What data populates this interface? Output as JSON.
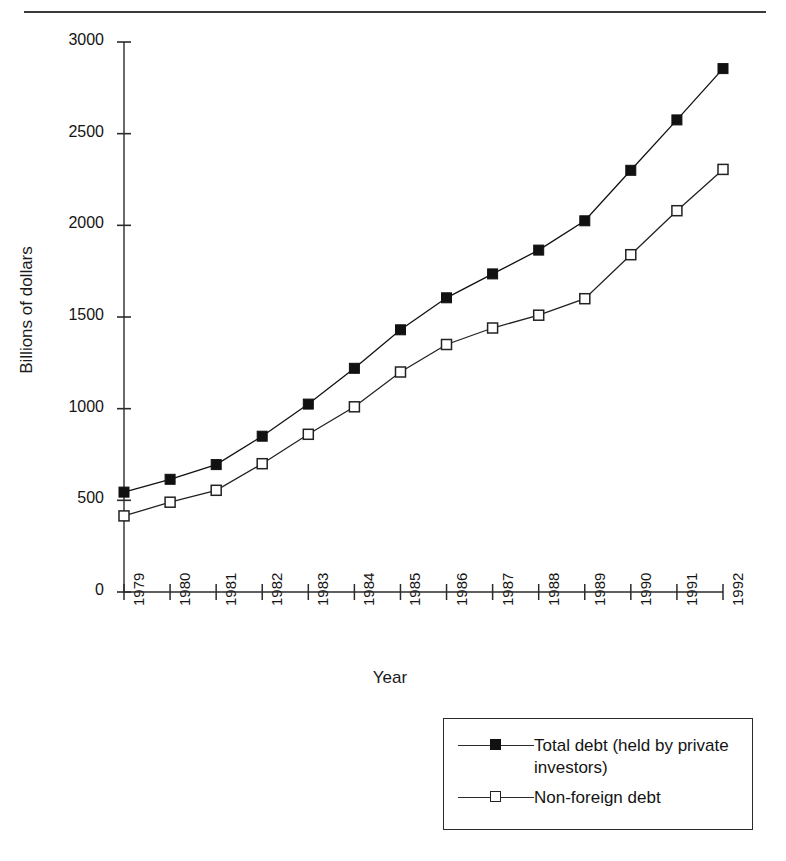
{
  "page": {
    "clipped_header_text": "",
    "rule_color": "#3a3a3a"
  },
  "chart": {
    "ylabel": "Billions of dollars",
    "xlabel": "Year",
    "y_ticks": [
      "0",
      "500",
      "1000",
      "1500",
      "2000",
      "2500",
      "3000"
    ],
    "x_ticks": [
      "1979",
      "1980",
      "1981",
      "1982",
      "1983",
      "1984",
      "1985",
      "1986",
      "1987",
      "1988",
      "1989",
      "1990",
      "1991",
      "1992"
    ],
    "legend": [
      {
        "label": "Total debt (held by private investors)",
        "marker": "filled-square",
        "color": "#111111"
      },
      {
        "label": "Non-foreign debt",
        "marker": "open-square",
        "color": "#222222"
      }
    ]
  },
  "chart_data": {
    "type": "line",
    "title": "",
    "subtitle": "",
    "xlabel": "Year",
    "ylabel": "Billions of dollars",
    "categories": [
      "1979",
      "1980",
      "1981",
      "1982",
      "1983",
      "1984",
      "1985",
      "1986",
      "1987",
      "1988",
      "1989",
      "1990",
      "1991",
      "1992"
    ],
    "x": [
      1979,
      1980,
      1981,
      1982,
      1983,
      1984,
      1985,
      1986,
      1987,
      1988,
      1989,
      1990,
      1991,
      1992
    ],
    "series": [
      {
        "name": "Total debt (held by private investors)",
        "marker": "filled-square",
        "color": "#111111",
        "values": [
          545,
          615,
          695,
          850,
          1025,
          1220,
          1430,
          1605,
          1735,
          1865,
          2025,
          2300,
          2575,
          2855
        ]
      },
      {
        "name": "Non-foreign debt",
        "marker": "open-square",
        "color": "#222222",
        "values": [
          415,
          490,
          555,
          700,
          860,
          1010,
          1200,
          1350,
          1440,
          1510,
          1600,
          1840,
          2080,
          2305
        ]
      }
    ],
    "ylim": [
      0,
      3000
    ],
    "ytick_values": [
      0,
      500,
      1000,
      1500,
      2000,
      2500,
      3000
    ],
    "xlim": [
      1979,
      1992
    ],
    "grid": false,
    "legend_position": "bottom-right"
  }
}
